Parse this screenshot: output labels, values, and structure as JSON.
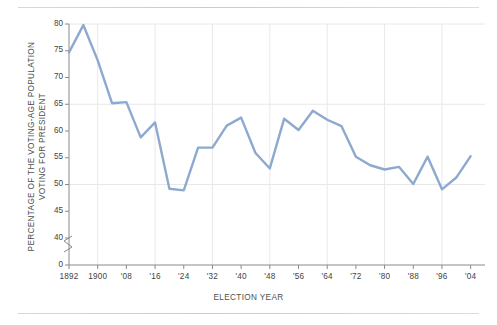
{
  "figure": {
    "background_color": "#ffffff",
    "rule_color": "#dcc6ae",
    "line_color": "#8ea9cf",
    "grid_color": "#e8e8e8",
    "axis_color": "#8a8a8a",
    "text_color": "#4a4a4a"
  },
  "axis_break": {
    "symbol": "axis-break",
    "present": true
  },
  "chart_data": {
    "type": "line",
    "title": "",
    "subtitle": "",
    "xlabel": "ELECTION YEAR",
    "ylabel": "PERCENTAGE OF THE VOTING-AGE POPULATION VOTING FOR PRESIDENT",
    "ylabel_line1": "PERCENTAGE OF THE VOTING-AGE POPULATION",
    "ylabel_line2": "VOTING FOR PRESIDENT",
    "grid": true,
    "legend": "none",
    "xlim": [
      1892,
      2008
    ],
    "ylim": [
      40,
      80
    ],
    "yticks": [
      0,
      40,
      45,
      50,
      55,
      60,
      65,
      70,
      75,
      80
    ],
    "ytick_labels": [
      "0",
      "40",
      "45",
      "50",
      "55",
      "60",
      "65",
      "70",
      "75",
      "80"
    ],
    "xticks": [
      1892,
      1900,
      1908,
      1916,
      1924,
      1932,
      1940,
      1948,
      1956,
      1964,
      1972,
      1980,
      1988,
      1996,
      2004
    ],
    "xtick_labels": [
      "1892",
      "1900",
      "'08",
      "'16",
      "'24",
      "'32",
      "'40",
      "'48",
      "'56",
      "'64",
      "'72",
      "'80",
      "'88",
      "'96",
      "'04"
    ],
    "x": [
      1892,
      1896,
      1900,
      1904,
      1908,
      1912,
      1916,
      1920,
      1924,
      1928,
      1932,
      1936,
      1940,
      1944,
      1948,
      1952,
      1956,
      1960,
      1964,
      1968,
      1972,
      1976,
      1980,
      1984,
      1988,
      1992,
      1996,
      2000,
      2004
    ],
    "values": [
      74.7,
      79.8,
      73.2,
      65.2,
      65.4,
      58.8,
      61.6,
      49.2,
      48.9,
      56.9,
      56.9,
      61.0,
      62.5,
      55.9,
      53.0,
      62.3,
      60.2,
      63.8,
      62.1,
      60.9,
      55.2,
      53.6,
      52.8,
      53.3,
      50.1,
      55.2,
      49.1,
      51.3,
      55.3
    ],
    "series": [
      {
        "name": "Voter turnout",
        "values": [
          74.7,
          79.8,
          73.2,
          65.2,
          65.4,
          58.8,
          61.6,
          49.2,
          48.9,
          56.9,
          56.9,
          61.0,
          62.5,
          55.9,
          53.0,
          62.3,
          60.2,
          63.8,
          62.1,
          60.9,
          55.2,
          53.6,
          52.8,
          53.3,
          50.1,
          55.2,
          49.1,
          51.3,
          55.3
        ]
      }
    ]
  }
}
